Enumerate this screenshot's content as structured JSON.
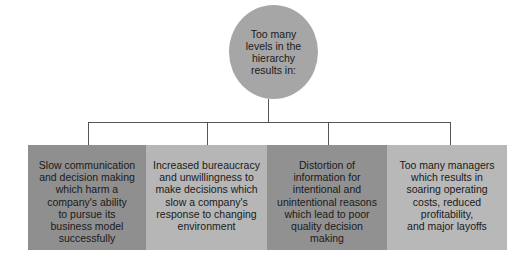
{
  "diagram": {
    "root": {
      "label": "Too many levels in the hierarchy results in:",
      "lines": [
        "Too many",
        "levels in the",
        "hierarchy",
        "results in:"
      ],
      "color": "#a6a6a6"
    },
    "children": [
      {
        "lines": [
          "Slow communication",
          "and decision making",
          "which harm a",
          "company's ability",
          "to pursue its",
          "business model",
          "successfully"
        ],
        "color": "#8f8f8f"
      },
      {
        "lines": [
          "Increased bureaucracy",
          "and unwillingness to",
          "make decisions which",
          "slow a company's",
          "response to changing",
          "environment"
        ],
        "color": "#b6b6b6"
      },
      {
        "lines": [
          "Distortion of",
          "information for",
          "intentional and",
          "unintentional reasons",
          "which lead to poor",
          "quality decision",
          "making"
        ],
        "color": "#919191"
      },
      {
        "lines": [
          "Too many managers",
          "which results in",
          "soaring operating",
          "costs, reduced",
          "profitability,",
          "and major layoffs"
        ],
        "color": "#b8b8b8"
      }
    ],
    "connector_color": "#555555"
  }
}
